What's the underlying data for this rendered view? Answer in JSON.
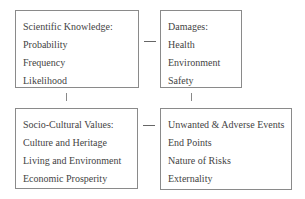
{
  "diagram": {
    "boxes": [
      {
        "title": "Scientific Knowledge:",
        "items": [
          "Probability",
          "Frequency",
          "Likelihood"
        ]
      },
      {
        "title": "Damages:",
        "items": [
          "Health",
          "Environment",
          "Safety"
        ]
      },
      {
        "title": "Socio-Cultural Values:",
        "items": [
          "Culture and Heritage",
          "Living and Environment",
          "Economic Prosperity"
        ]
      },
      {
        "title": "",
        "items": [
          "Unwanted & Adverse Events",
          "End Points",
          "Nature of Risks",
          "Externality"
        ]
      }
    ],
    "connectors": [
      {
        "from": "Scientific Knowledge",
        "to": "Damages",
        "orientation": "horizontal"
      },
      {
        "from": "Scientific Knowledge",
        "to": "Socio-Cultural Values",
        "orientation": "vertical"
      },
      {
        "from": "Damages",
        "to": "Unwanted & Adverse Events",
        "orientation": "vertical"
      },
      {
        "from": "Socio-Cultural Values",
        "to": "Unwanted & Adverse Events",
        "orientation": "horizontal"
      }
    ]
  }
}
